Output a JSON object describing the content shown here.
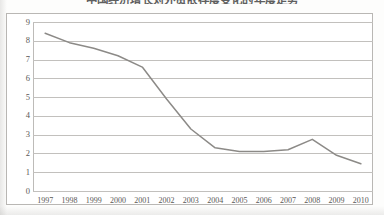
{
  "chart_data": {
    "type": "line",
    "title": "中国经济增长对外贸依存度变化的年度走势",
    "title_note": "cropped-at-image-top",
    "xlabel": "",
    "ylabel": "",
    "categories": [
      "1997",
      "1998",
      "1999",
      "2000",
      "2001",
      "2002",
      "2003",
      "2004",
      "2005",
      "2006",
      "2007",
      "2008",
      "2009",
      "2010"
    ],
    "x": [
      1997,
      1998,
      1999,
      2000,
      2001,
      2002,
      2003,
      2004,
      2005,
      2006,
      2007,
      2008,
      2009,
      2010
    ],
    "series": [
      {
        "name": "series-1",
        "values": [
          8.4,
          7.9,
          7.6,
          7.2,
          6.6,
          4.9,
          3.3,
          2.3,
          2.1,
          2.1,
          2.2,
          2.75,
          1.9,
          1.45
        ]
      }
    ],
    "ylim": [
      0,
      9
    ],
    "yticks": [
      0,
      1,
      2,
      3,
      4,
      5,
      6,
      7,
      8,
      9
    ],
    "ytick_labels": [
      "0",
      "1",
      "2",
      "3",
      "4",
      "5",
      "6",
      "7",
      "8",
      "9"
    ],
    "grid": true,
    "grid_axis": "y",
    "legend": false,
    "legend_position": "none",
    "line_color": "#8c8a87",
    "grid_color": "#c2c0bd",
    "frame_color": "#b9b7b4",
    "background_color": "#ffffff"
  }
}
